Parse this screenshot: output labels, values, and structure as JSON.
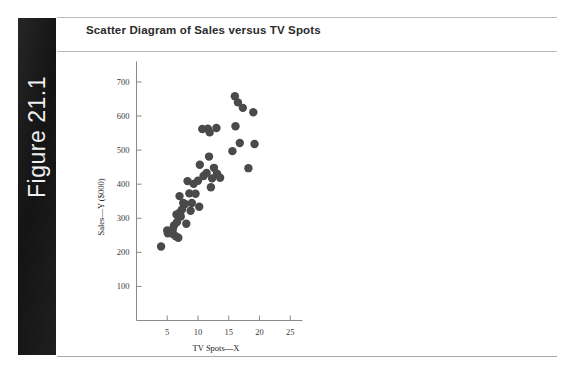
{
  "figure": {
    "label": "Figure 21.1"
  },
  "chart_title": "Scatter Diagram of Sales versus TV Spots",
  "chart_data": {
    "type": "scatter",
    "title": "Scatter Diagram of Sales versus TV Spots",
    "xlabel": "TV Spots—X",
    "ylabel": "Sales—Y ($000)",
    "xlim": [
      0,
      27
    ],
    "ylim": [
      0,
      760
    ],
    "xticks": [
      5,
      10,
      15,
      20,
      25
    ],
    "yticks": [
      100,
      200,
      300,
      400,
      500,
      600,
      700
    ],
    "grid": false,
    "legend": null,
    "marker": {
      "shape": "circle",
      "color": "#4a4a4a",
      "size": 4.2
    },
    "points": [
      {
        "x": 4.0,
        "y": 217
      },
      {
        "x": 5.0,
        "y": 264
      },
      {
        "x": 5.1,
        "y": 256
      },
      {
        "x": 5.9,
        "y": 268
      },
      {
        "x": 6.0,
        "y": 253
      },
      {
        "x": 6.1,
        "y": 279
      },
      {
        "x": 6.4,
        "y": 247
      },
      {
        "x": 6.5,
        "y": 311
      },
      {
        "x": 6.6,
        "y": 289
      },
      {
        "x": 6.8,
        "y": 243
      },
      {
        "x": 7.0,
        "y": 365
      },
      {
        "x": 7.1,
        "y": 318
      },
      {
        "x": 7.2,
        "y": 305
      },
      {
        "x": 7.4,
        "y": 326
      },
      {
        "x": 7.6,
        "y": 345
      },
      {
        "x": 7.9,
        "y": 342
      },
      {
        "x": 8.1,
        "y": 284
      },
      {
        "x": 8.3,
        "y": 409
      },
      {
        "x": 8.6,
        "y": 373
      },
      {
        "x": 8.8,
        "y": 322
      },
      {
        "x": 9.0,
        "y": 345
      },
      {
        "x": 9.3,
        "y": 401
      },
      {
        "x": 9.6,
        "y": 372
      },
      {
        "x": 10.0,
        "y": 410
      },
      {
        "x": 10.2,
        "y": 334
      },
      {
        "x": 10.3,
        "y": 457
      },
      {
        "x": 10.7,
        "y": 562
      },
      {
        "x": 10.9,
        "y": 424
      },
      {
        "x": 11.4,
        "y": 433
      },
      {
        "x": 11.6,
        "y": 563
      },
      {
        "x": 11.8,
        "y": 481
      },
      {
        "x": 11.9,
        "y": 552
      },
      {
        "x": 12.1,
        "y": 391
      },
      {
        "x": 12.3,
        "y": 417
      },
      {
        "x": 12.6,
        "y": 448
      },
      {
        "x": 13.0,
        "y": 565
      },
      {
        "x": 13.1,
        "y": 431
      },
      {
        "x": 13.6,
        "y": 419
      },
      {
        "x": 15.6,
        "y": 497
      },
      {
        "x": 16.0,
        "y": 658
      },
      {
        "x": 16.1,
        "y": 570
      },
      {
        "x": 16.5,
        "y": 640
      },
      {
        "x": 16.8,
        "y": 521
      },
      {
        "x": 17.3,
        "y": 624
      },
      {
        "x": 18.2,
        "y": 447
      },
      {
        "x": 19.0,
        "y": 611
      },
      {
        "x": 19.2,
        "y": 518
      }
    ]
  }
}
